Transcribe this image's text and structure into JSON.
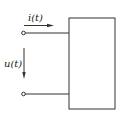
{
  "diagram": {
    "type": "two-terminal network (one-port)",
    "current_label": "i(t)",
    "voltage_label": "u(t)",
    "colors": {
      "line": "#333333",
      "background": "#ffffff"
    }
  }
}
